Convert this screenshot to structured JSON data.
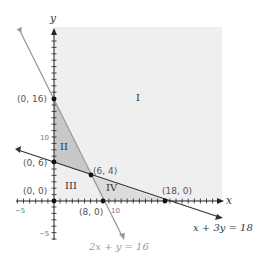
{
  "diagram": {
    "type": "linear-programming-feasible-regions",
    "axes": {
      "x_label": "x",
      "y_label": "y",
      "x_tick_labels": [
        {
          "value": -5,
          "text": "−5"
        },
        {
          "value": 10,
          "text": "10"
        }
      ],
      "y_tick_labels": [
        {
          "value": -5,
          "text": "−5"
        },
        {
          "value": 10,
          "text": "10"
        }
      ],
      "x_range": [
        -6,
        27
      ],
      "y_range": [
        -6,
        27
      ]
    },
    "lines": [
      {
        "equation": "2x + y = 16",
        "color": "#999999",
        "label": "2x + y = 16"
      },
      {
        "equation": "x + 3y = 18",
        "color": "#333333",
        "label": "x + 3y = 18"
      }
    ],
    "points": [
      {
        "label": "(0, 16)",
        "x": 0,
        "y": 16
      },
      {
        "label": "(0, 6)",
        "x": 0,
        "y": 6
      },
      {
        "label": "(6, 4)",
        "x": 6,
        "y": 4
      },
      {
        "label": "(0, 0)",
        "x": 0,
        "y": 0
      },
      {
        "label": "(8, 0)",
        "x": 8,
        "y": 0
      },
      {
        "label": "(18, 0)",
        "x": 18,
        "y": 0
      }
    ],
    "regions": [
      {
        "label": "I",
        "fill": "#efefef"
      },
      {
        "label": "II",
        "fill": "#c8c8c8"
      },
      {
        "label": "III",
        "fill": "#efefef"
      },
      {
        "label": "IV",
        "fill": "#dcdcdc"
      }
    ],
    "colors": {
      "first_quadrant_shade": "#efefef",
      "region_ii": "#c8c8c8",
      "region_iv": "#dcdcdc",
      "axis": "#222222",
      "gray_line": "#9a9a9a",
      "dark_line": "#333333"
    }
  }
}
